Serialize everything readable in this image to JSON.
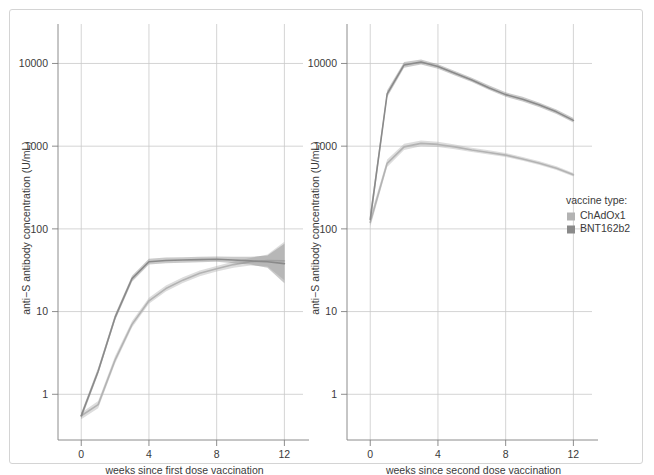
{
  "figure": {
    "background_color": "#ffffff",
    "border_color": "#d4d4d4",
    "grid_color": "#c9c9c9",
    "axis_color": "#808080",
    "text_color": "#3a3a3a"
  },
  "legend": {
    "title": "vaccine type:",
    "position": "right",
    "entries": [
      {
        "label": "ChAdOx1",
        "color": "#b3b3b3"
      },
      {
        "label": "BNT162b2",
        "color": "#8a8a8a"
      }
    ]
  },
  "chart_data": [
    {
      "type": "line",
      "panel_index": 0,
      "title": "",
      "xlabel": "weeks since first dose vaccination",
      "ylabel": "anti−S antibody concentration (U/mL)",
      "yscale": "log",
      "ylim": [
        0.35,
        30000
      ],
      "xlim": [
        -0.9,
        13.1
      ],
      "xticks": [
        0,
        4,
        8,
        12
      ],
      "xticklabels": [
        "0",
        "4",
        "8",
        "12"
      ],
      "yticks": [
        1,
        10,
        100,
        1000,
        10000
      ],
      "yticklabels": [
        "1",
        "10",
        "100",
        "1000",
        "10000"
      ],
      "grid": true,
      "x": [
        0,
        1,
        2,
        3,
        4,
        5,
        6,
        7,
        8,
        9,
        10,
        11,
        12
      ],
      "series": [
        {
          "name": "ChAdOx1",
          "color": "#b3b3b3",
          "values": [
            0.55,
            0.75,
            2.6,
            7.0,
            13.5,
            19.0,
            24.0,
            29.0,
            33.0,
            37.0,
            40.0,
            41.5,
            41.0
          ],
          "ci_lower": [
            0.5,
            0.68,
            2.35,
            6.4,
            12.4,
            17.5,
            22.2,
            26.8,
            30.6,
            34.0,
            36.0,
            35.0,
            24.0
          ],
          "ci_upper": [
            0.6,
            0.83,
            2.9,
            7.7,
            14.7,
            20.6,
            26.0,
            31.4,
            35.6,
            40.3,
            44.5,
            49.0,
            70.0
          ]
        },
        {
          "name": "BNT162b2",
          "color": "#8a8a8a",
          "values": [
            0.55,
            1.9,
            8.5,
            25.0,
            40.0,
            41.5,
            42.0,
            42.5,
            43.0,
            42.0,
            41.0,
            40.0,
            38.0
          ],
          "ci_lower": [
            0.5,
            1.75,
            7.8,
            23.0,
            37.0,
            38.5,
            39.0,
            39.5,
            40.0,
            38.5,
            37.0,
            34.0,
            22.0
          ],
          "ci_upper": [
            0.6,
            2.1,
            9.3,
            27.2,
            43.5,
            45.0,
            45.5,
            46.0,
            46.5,
            46.0,
            46.0,
            47.5,
            66.0
          ]
        }
      ]
    },
    {
      "type": "line",
      "panel_index": 1,
      "title": "",
      "xlabel": "weeks since second dose vaccination",
      "ylabel": "anti−S antibody concentration (U/mL)",
      "yscale": "log",
      "ylim": [
        0.35,
        30000
      ],
      "xlim": [
        -0.9,
        13.1
      ],
      "xticks": [
        0,
        4,
        8,
        12
      ],
      "xticklabels": [
        "0",
        "4",
        "8",
        "12"
      ],
      "yticks": [
        1,
        10,
        100,
        1000,
        10000
      ],
      "yticklabels": [
        "1",
        "10",
        "100",
        "1000",
        "10000"
      ],
      "grid": true,
      "x": [
        0,
        1,
        2,
        3,
        4,
        5,
        6,
        7,
        8,
        9,
        10,
        11,
        12
      ],
      "series": [
        {
          "name": "ChAdOx1",
          "color": "#b3b3b3",
          "values": [
            120,
            620,
            980,
            1080,
            1050,
            980,
            900,
            840,
            780,
            700,
            620,
            540,
            450
          ],
          "ci_lower": [
            105,
            560,
            900,
            1000,
            980,
            920,
            850,
            795,
            740,
            665,
            590,
            515,
            430
          ],
          "ci_upper": [
            140,
            690,
            1070,
            1170,
            1130,
            1050,
            955,
            890,
            825,
            740,
            655,
            570,
            475
          ]
        },
        {
          "name": "BNT162b2",
          "color": "#8a8a8a",
          "values": [
            130,
            4300,
            9600,
            10400,
            9200,
            7600,
            6300,
            5100,
            4200,
            3700,
            3150,
            2600,
            2050
          ],
          "ci_lower": [
            110,
            3900,
            8900,
            9700,
            8650,
            7150,
            5950,
            4800,
            3950,
            3480,
            2960,
            2450,
            1930
          ],
          "ci_upper": [
            160,
            4750,
            10400,
            11200,
            9800,
            8100,
            6700,
            5450,
            4480,
            3950,
            3360,
            2780,
            2190
          ]
        }
      ]
    }
  ]
}
